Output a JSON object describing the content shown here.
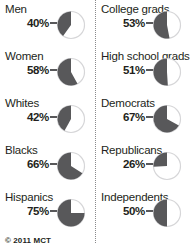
{
  "footer": {
    "credit": "© 2011 MCT"
  },
  "colors": {
    "wedge": "#58585a",
    "circle_bg": "#ffffff",
    "circle_ring": "#d6d6d8",
    "text": "#231f20",
    "divider": "#8a8a8c"
  },
  "chart_data": {
    "type": "pie",
    "title": "",
    "subtitle": "",
    "xlabel": "",
    "ylabel": "",
    "legend_position": "none",
    "grid": false,
    "note": "Ten separate single-value pie charts, each shaded counter-clockwise from 12 o'clock",
    "columns": [
      {
        "name": "demographics",
        "items": [
          {
            "label": "Men",
            "value": 40,
            "value_text": "40%"
          },
          {
            "label": "Women",
            "value": 58,
            "value_text": "58%"
          },
          {
            "label": "Whites",
            "value": 42,
            "value_text": "42%"
          },
          {
            "label": "Blacks",
            "value": 66,
            "value_text": "66%"
          },
          {
            "label": "Hispanics",
            "value": 75,
            "value_text": "75%"
          }
        ]
      },
      {
        "name": "education-and-party",
        "items": [
          {
            "label": "College grads",
            "value": 53,
            "value_text": "53%"
          },
          {
            "label": "High school grads",
            "value": 51,
            "value_text": "51%"
          },
          {
            "label": "Democrats",
            "value": 67,
            "value_text": "67%"
          },
          {
            "label": "Republicans",
            "value": 26,
            "value_text": "26%"
          },
          {
            "label": "Independents",
            "value": 50,
            "value_text": "50%"
          }
        ]
      }
    ]
  }
}
